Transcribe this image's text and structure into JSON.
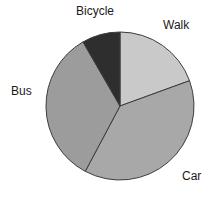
{
  "chart_data": {
    "type": "pie",
    "title": "",
    "subtitle": "",
    "xlabel": "",
    "ylabel": "",
    "legend_position": "none",
    "labels_position": "outside",
    "grid": false,
    "categories": [
      "Walk",
      "Car",
      "Bus",
      "Bicycle"
    ],
    "values": [
      19,
      38,
      34,
      9
    ],
    "units": "percent",
    "start_angle_deg": 0,
    "direction": "clockwise",
    "slices": [
      {
        "label": "Walk",
        "value": 19,
        "color": "#c9c9c9",
        "start_angle_deg": 0,
        "end_angle_deg": 70
      },
      {
        "label": "Car",
        "value": 38,
        "color": "#a8a8a8",
        "start_angle_deg": 70,
        "end_angle_deg": 208
      },
      {
        "label": "Bus",
        "value": 34,
        "color": "#9c9c9c",
        "start_angle_deg": 208,
        "end_angle_deg": 330
      },
      {
        "label": "Bicycle",
        "value": 9,
        "color": "#2e2e2e",
        "start_angle_deg": 330,
        "end_angle_deg": 360
      }
    ]
  },
  "chart": {
    "background_color": "#ffffff",
    "outline_color": "#3c3c3c",
    "text_color": "#1a1a1a",
    "center_x": 120,
    "center_y": 106,
    "radius": 74,
    "labels": {
      "bicycle": "Bicycle",
      "walk": "Walk",
      "bus": "Bus",
      "car": "Car"
    }
  }
}
